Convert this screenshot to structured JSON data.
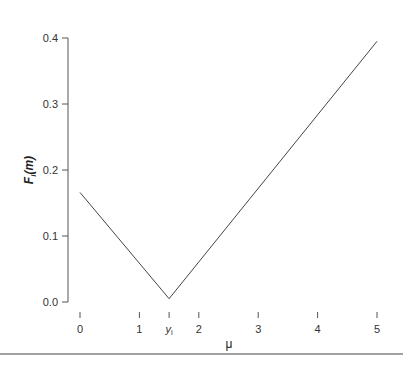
{
  "chart_data": {
    "type": "line",
    "title": "",
    "xlabel": "μ",
    "ylabel": "F_i(m)",
    "ylabel_main": "F",
    "ylabel_sub": "i",
    "ylabel_arg": "(m)",
    "xlim": [
      0,
      5
    ],
    "ylim": [
      0,
      0.4
    ],
    "grid": false,
    "legend": null,
    "x_ticks": [
      {
        "value": 0,
        "label": "0"
      },
      {
        "value": 1,
        "label": "1"
      },
      {
        "value": 1.5,
        "label": "y_i",
        "label_main": "y",
        "label_sub": "i"
      },
      {
        "value": 2,
        "label": "2"
      },
      {
        "value": 3,
        "label": "3"
      },
      {
        "value": 4,
        "label": "4"
      },
      {
        "value": 5,
        "label": "5"
      }
    ],
    "y_ticks": [
      {
        "value": 0.0,
        "label": "0.0"
      },
      {
        "value": 0.1,
        "label": "0.1"
      },
      {
        "value": 0.2,
        "label": "0.2"
      },
      {
        "value": 0.3,
        "label": "0.3"
      },
      {
        "value": 0.4,
        "label": "0.4"
      }
    ],
    "series": [
      {
        "name": "F_i(m)",
        "color": "#444444",
        "x": [
          0,
          1.5,
          5
        ],
        "y": [
          0.166,
          0.005,
          0.395
        ]
      }
    ],
    "x_axis_gradient_colors": [
      "#8a7a8a",
      "#5a5ac8",
      "#9ac870",
      "#c8a080",
      "#555555"
    ]
  }
}
